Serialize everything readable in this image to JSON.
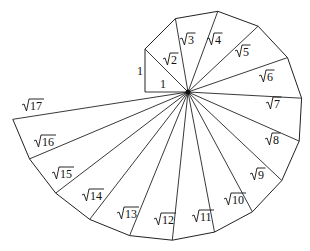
{
  "diagram": {
    "title": "",
    "type": "spiral-of-theodorus",
    "center": [
      188,
      92
    ],
    "unit_px": 43,
    "line_color": "#222222",
    "background": "#ffffff",
    "leg_labels": [
      {
        "text": "1",
        "x": 137,
        "y": 75,
        "for": "initial-vertical-leg"
      },
      {
        "text": "1",
        "x": 160,
        "y": 88,
        "for": "initial-horizontal-leg"
      }
    ],
    "vertices": [
      [
        145,
        92
      ],
      [
        145,
        49
      ],
      [
        175.4,
        18.6
      ],
      [
        217.8,
        11.3
      ],
      [
        258.1,
        26.2
      ],
      [
        287.5,
        57.6
      ],
      [
        301.6,
        98.2
      ],
      [
        299.2,
        141.1
      ],
      [
        281.8,
        180.5
      ],
      [
        252.4,
        211.8
      ],
      [
        214.5,
        232.1
      ],
      [
        172.3,
        240.2
      ],
      [
        129.6,
        235.6
      ],
      [
        89.7,
        219.4
      ],
      [
        55.7,
        193.1
      ],
      [
        29.5,
        158.9
      ],
      [
        12.8,
        119.3
      ]
    ],
    "hypotenuse_labels": [
      {
        "radicand": "2",
        "x": 163,
        "y": 64
      },
      {
        "radicand": "3",
        "x": 180,
        "y": 44
      },
      {
        "radicand": "4",
        "x": 207,
        "y": 44
      },
      {
        "radicand": "5",
        "x": 235,
        "y": 56
      },
      {
        "radicand": "6",
        "x": 259,
        "y": 81
      },
      {
        "radicand": "7",
        "x": 266,
        "y": 108
      },
      {
        "radicand": "8",
        "x": 265,
        "y": 144
      },
      {
        "radicand": "9",
        "x": 250,
        "y": 179
      },
      {
        "radicand": "10",
        "x": 224,
        "y": 204
      },
      {
        "radicand": "11",
        "x": 192,
        "y": 221
      },
      {
        "radicand": "12",
        "x": 154,
        "y": 224
      },
      {
        "radicand": "13",
        "x": 117,
        "y": 218
      },
      {
        "radicand": "14",
        "x": 82,
        "y": 200
      },
      {
        "radicand": "15",
        "x": 52,
        "y": 178
      },
      {
        "radicand": "16",
        "x": 34,
        "y": 146
      },
      {
        "radicand": "17",
        "x": 22,
        "y": 110
      }
    ]
  }
}
